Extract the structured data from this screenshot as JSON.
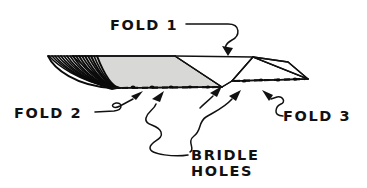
{
  "figure": {
    "background_color": "#ffffff",
    "ink_color": "#111111",
    "panel_fill_gray": "#d8d8d6",
    "panel_fill_white": "#ffffff"
  },
  "labels": {
    "fold1": "FOLD 1",
    "fold2": "FOLD 2",
    "fold3": "FOLD 3",
    "bridle_line1": "BRIDLE",
    "bridle_line2": "HOLES"
  },
  "callouts": [
    {
      "name": "fold-1",
      "text": "FOLD 1",
      "points_to": "top edge of right fold panel"
    },
    {
      "name": "fold-2",
      "text": "FOLD 2",
      "points_to": "left bridle hole row"
    },
    {
      "name": "fold-3",
      "text": "FOLD 3",
      "points_to": "right fold peak"
    },
    {
      "name": "bridle-holes",
      "text": "BRIDLE HOLES",
      "points_to": "both dashed hole rows"
    }
  ],
  "shape_data": {
    "type": "diagram",
    "hatched_end_line_count": 17,
    "bridle_hole_rows": 2,
    "left_row_hole_count": 9,
    "right_row_hole_count": 8,
    "folds": 3
  }
}
